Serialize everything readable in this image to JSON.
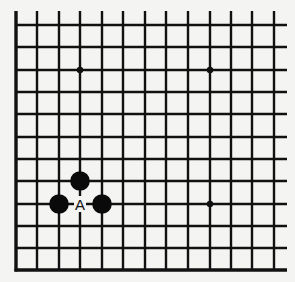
{
  "diagram": {
    "type": "go-board-fragment",
    "grid": {
      "columns_x": [
        16,
        37,
        59,
        80,
        102,
        123,
        145,
        166,
        188,
        210,
        231,
        252,
        274
      ],
      "rows_y": [
        25,
        47,
        70,
        92,
        114,
        137,
        159,
        181,
        204,
        226,
        248,
        270
      ],
      "extend_top_to": 11,
      "extend_right_to": 287,
      "edges": [
        "left",
        "bottom"
      ]
    },
    "star_points": [
      {
        "col": 3,
        "row": 2
      },
      {
        "col": 9,
        "row": 2
      },
      {
        "col": 9,
        "row": 8
      }
    ],
    "stones": [
      {
        "color": "black",
        "col": 3,
        "row": 7
      },
      {
        "color": "black",
        "col": 2,
        "row": 8
      },
      {
        "color": "black",
        "col": 4,
        "row": 8
      }
    ],
    "labels": [
      {
        "text": "A",
        "col": 3,
        "row": 8
      }
    ],
    "colors": {
      "line": "#111111",
      "stone_black": "#0a0a0a",
      "background": "#f4f4f2"
    }
  }
}
